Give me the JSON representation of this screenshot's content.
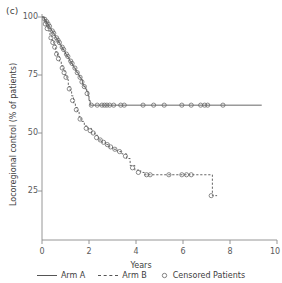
{
  "panel": {
    "label": "(c)"
  },
  "axes": {
    "xlabel": "Years",
    "ylabel": "Locoregional control (% of patients)",
    "xticks": [
      "0",
      "2",
      "4",
      "6",
      "8",
      "10"
    ],
    "yticks": [
      "100",
      "75",
      "50",
      "25"
    ]
  },
  "legend": {
    "items": [
      {
        "label": "Arm A",
        "style": "solid",
        "icon": "solid-line-icon"
      },
      {
        "label": "Arm B",
        "style": "dashed",
        "icon": "dashed-line-icon"
      },
      {
        "label": "Censored Patients",
        "style": "marker",
        "icon": "open-circle-icon"
      }
    ]
  },
  "colors": {
    "line": "#555555",
    "axis": "#8a8a8a",
    "text": "#3d3d3d",
    "marker": "#666666"
  },
  "chart_data": {
    "type": "line",
    "subtype": "kaplan-meier-step",
    "title": "",
    "xlabel": "Years",
    "ylabel": "Locoregional control (% of patients)",
    "xlim": [
      0,
      10
    ],
    "ylim": [
      0,
      100
    ],
    "xticks": [
      0,
      2,
      4,
      6,
      8,
      10
    ],
    "yticks": [
      25,
      50,
      75,
      100
    ],
    "grid": false,
    "legend_position": "bottom",
    "series": [
      {
        "name": "Arm A",
        "style": "solid",
        "points": [
          [
            0.0,
            100
          ],
          [
            0.1,
            99
          ],
          [
            0.16,
            98
          ],
          [
            0.22,
            97
          ],
          [
            0.28,
            96
          ],
          [
            0.34,
            95
          ],
          [
            0.4,
            94
          ],
          [
            0.46,
            93
          ],
          [
            0.52,
            92
          ],
          [
            0.58,
            91
          ],
          [
            0.64,
            90
          ],
          [
            0.7,
            89
          ],
          [
            0.76,
            88
          ],
          [
            0.82,
            87
          ],
          [
            0.88,
            86
          ],
          [
            0.94,
            85
          ],
          [
            1.0,
            84
          ],
          [
            1.06,
            83
          ],
          [
            1.12,
            82
          ],
          [
            1.18,
            81
          ],
          [
            1.24,
            80
          ],
          [
            1.3,
            79
          ],
          [
            1.36,
            78
          ],
          [
            1.42,
            77
          ],
          [
            1.48,
            76
          ],
          [
            1.54,
            75
          ],
          [
            1.6,
            74
          ],
          [
            1.66,
            73
          ],
          [
            1.72,
            71
          ],
          [
            1.78,
            70
          ],
          [
            1.84,
            69
          ],
          [
            1.9,
            68
          ],
          [
            1.96,
            66
          ],
          [
            2.0,
            64
          ],
          [
            2.05,
            62
          ],
          [
            9.35,
            62
          ]
        ],
        "censored": [
          [
            0.12,
            99
          ],
          [
            0.2,
            98
          ],
          [
            0.26,
            97
          ],
          [
            0.32,
            96
          ],
          [
            0.44,
            94
          ],
          [
            0.5,
            93
          ],
          [
            0.62,
            91
          ],
          [
            0.68,
            90
          ],
          [
            0.74,
            89
          ],
          [
            0.86,
            87
          ],
          [
            0.92,
            86
          ],
          [
            1.04,
            84
          ],
          [
            1.1,
            83
          ],
          [
            1.22,
            81
          ],
          [
            1.28,
            80
          ],
          [
            1.4,
            78
          ],
          [
            1.5,
            76
          ],
          [
            1.62,
            74
          ],
          [
            1.7,
            72
          ],
          [
            1.8,
            70
          ],
          [
            1.92,
            67
          ],
          [
            2.1,
            62
          ],
          [
            2.35,
            62
          ],
          [
            2.55,
            62
          ],
          [
            2.66,
            62
          ],
          [
            2.76,
            62
          ],
          [
            2.88,
            62
          ],
          [
            3.05,
            62
          ],
          [
            3.35,
            62
          ],
          [
            3.5,
            62
          ],
          [
            4.3,
            62
          ],
          [
            4.75,
            62
          ],
          [
            5.2,
            62
          ],
          [
            5.95,
            62
          ],
          [
            6.35,
            62
          ],
          [
            6.75,
            62
          ],
          [
            6.92,
            62
          ],
          [
            7.05,
            62
          ],
          [
            7.7,
            62
          ]
        ]
      },
      {
        "name": "Arm B",
        "style": "dashed",
        "points": [
          [
            0.0,
            100
          ],
          [
            0.1,
            98
          ],
          [
            0.18,
            96
          ],
          [
            0.26,
            94
          ],
          [
            0.34,
            92
          ],
          [
            0.42,
            90
          ],
          [
            0.5,
            88
          ],
          [
            0.58,
            85
          ],
          [
            0.66,
            83
          ],
          [
            0.74,
            81
          ],
          [
            0.82,
            79
          ],
          [
            0.9,
            77
          ],
          [
            0.98,
            75
          ],
          [
            1.06,
            73
          ],
          [
            1.12,
            70
          ],
          [
            1.2,
            68
          ],
          [
            1.26,
            66
          ],
          [
            1.34,
            63
          ],
          [
            1.42,
            61
          ],
          [
            1.5,
            59
          ],
          [
            1.58,
            57
          ],
          [
            1.66,
            55
          ],
          [
            1.8,
            53
          ],
          [
            1.95,
            52
          ],
          [
            2.1,
            50
          ],
          [
            2.25,
            49
          ],
          [
            2.4,
            47
          ],
          [
            2.55,
            46
          ],
          [
            2.7,
            45
          ],
          [
            2.85,
            44
          ],
          [
            3.0,
            43
          ],
          [
            3.2,
            42
          ],
          [
            3.4,
            41
          ],
          [
            3.6,
            39
          ],
          [
            3.75,
            36
          ],
          [
            3.95,
            34
          ],
          [
            4.2,
            33
          ],
          [
            4.35,
            32
          ],
          [
            7.15,
            32
          ],
          [
            7.25,
            23
          ],
          [
            7.45,
            23
          ]
        ],
        "censored": [
          [
            0.14,
            97
          ],
          [
            0.22,
            95
          ],
          [
            0.38,
            91
          ],
          [
            0.46,
            89
          ],
          [
            0.54,
            87
          ],
          [
            0.62,
            84
          ],
          [
            0.7,
            82
          ],
          [
            0.86,
            78
          ],
          [
            0.94,
            76
          ],
          [
            1.02,
            74
          ],
          [
            1.16,
            69
          ],
          [
            1.3,
            64
          ],
          [
            1.46,
            60
          ],
          [
            1.62,
            56
          ],
          [
            1.88,
            52
          ],
          [
            2.05,
            51
          ],
          [
            2.18,
            50
          ],
          [
            2.32,
            48
          ],
          [
            2.48,
            47
          ],
          [
            2.62,
            46
          ],
          [
            2.78,
            45
          ],
          [
            2.92,
            44
          ],
          [
            3.1,
            43
          ],
          [
            3.3,
            42
          ],
          [
            3.55,
            40
          ],
          [
            3.85,
            35
          ],
          [
            4.1,
            33
          ],
          [
            4.45,
            32
          ],
          [
            4.6,
            32
          ],
          [
            5.4,
            32
          ],
          [
            5.95,
            32
          ],
          [
            6.15,
            32
          ],
          [
            6.35,
            32
          ],
          [
            7.2,
            23
          ]
        ]
      }
    ]
  }
}
